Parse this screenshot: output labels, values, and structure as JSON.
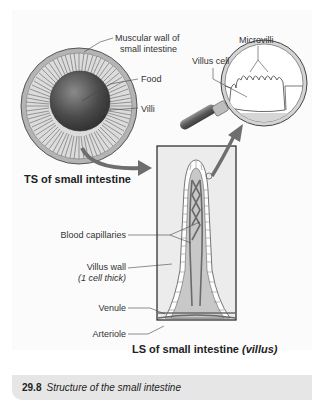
{
  "figure": {
    "number": "29.8",
    "caption": "Structure of the small intestine"
  },
  "ts_section": {
    "title": "TS of small intestine",
    "labels": {
      "muscular_wall_line1": "Muscular wall of",
      "muscular_wall_line2": "small intestine",
      "food": "Food",
      "villi": "Villi"
    }
  },
  "magnifier": {
    "labels": {
      "microvilli": "Microvilli",
      "villus_cell": "Villus cell"
    }
  },
  "ls_section": {
    "title_main": "LS of small intestine",
    "title_italic": "(villus)",
    "labels": {
      "blood_capillaries": "Blood capillaries",
      "villus_wall": "Villus wall",
      "villus_wall_note": "(1 cell thick)",
      "venule": "Venule",
      "arteriole": "Arteriole"
    }
  },
  "colors": {
    "outer_wall": "#b4b4b4",
    "villi_ring": "#d6d6d6",
    "food": "#555555",
    "arrow": "#6e6e6e",
    "villus_fill": "#c8c8c8",
    "vessel": "#6a6a6a",
    "caption_bg": "#e6e6e6"
  }
}
